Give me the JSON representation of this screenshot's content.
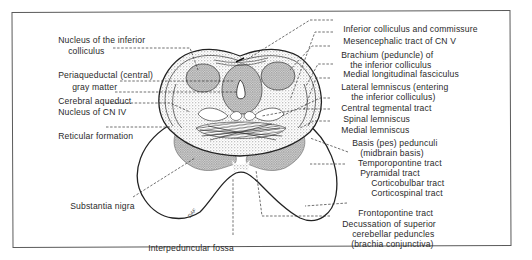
{
  "figure": {
    "type": "anatomical-diagram",
    "labels_left": [
      {
        "id": "nucleus-inferior-colliculus",
        "line1": "Nucleus of the inferior",
        "line2": "colliculus"
      },
      {
        "id": "periaqueductal-gray",
        "line1": "Periaqueductal (central)",
        "line2": "gray matter"
      },
      {
        "id": "cerebral-aqueduct",
        "line1": "Cerebral aqueduct"
      },
      {
        "id": "nucleus-cn-iv",
        "line1": "Nucleus of CN IV"
      },
      {
        "id": "reticular-formation",
        "line1": "Reticular formation"
      },
      {
        "id": "substantia-nigra",
        "line1": "Substantia nigra"
      }
    ],
    "labels_bottom": [
      {
        "id": "interpeduncular-fossa",
        "line1": "Interpeduncular fossa"
      }
    ],
    "labels_right": [
      {
        "id": "inferior-colliculus-commissure",
        "line1": "Inferior colliculus and commissure"
      },
      {
        "id": "mesencephalic-tract-cn-v",
        "line1": "Mesencephalic tract of CN V"
      },
      {
        "id": "brachium-inferior-colliculus",
        "line1": "Brachium (peduncle) of",
        "line2": "the inferior colliculus"
      },
      {
        "id": "medial-longitudinal-fasciculus",
        "line1": "Medial longitudinal fasciculus"
      },
      {
        "id": "lateral-lemniscus",
        "line1": "Lateral lemniscus (entering",
        "line2": "the inferior colliculus)"
      },
      {
        "id": "central-tegmental-tract",
        "line1": "Central tegmental tract"
      },
      {
        "id": "spinal-lemniscus",
        "line1": "Spinal lemniscus"
      },
      {
        "id": "medial-lemniscus",
        "line1": "Medial lemniscus"
      },
      {
        "id": "basis-pedunculi",
        "line1": "Basis (pes) pedunculi",
        "line2": "(midbrain basis)"
      },
      {
        "id": "temporopontine-tract",
        "line1": "Temporopontine tract"
      },
      {
        "id": "pyramidal-tract",
        "line1": "Pyramidal tract",
        "sub1": "Corticobulbar tract",
        "sub2": "Corticospinal tract"
      },
      {
        "id": "frontopontine-tract",
        "line1": "Frontopontine tract"
      },
      {
        "id": "decussation-superior-cerebellar-peduncles",
        "line1": "Decussation of superior",
        "line2": "cerebellar peduncles",
        "line3": "(brachia conjunctiva)"
      }
    ],
    "artist_signature": "DAF",
    "colors": {
      "ink": "#2a2a2a",
      "stipple": "#8a8a8a",
      "frame": "#5a5a5a",
      "background": "#ffffff"
    }
  }
}
